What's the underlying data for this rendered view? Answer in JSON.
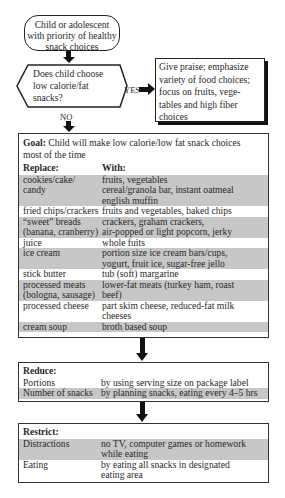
{
  "start": {
    "lines": [
      "Child or adolescent",
      "with priority of healthy",
      "snack choices"
    ]
  },
  "decision": {
    "lines": [
      "Does child choose",
      "low calorie/fat",
      "snacks?"
    ],
    "yes_label": "YES",
    "no_label": "NO"
  },
  "praise": {
    "lines": [
      "Give praise; emphasize",
      "variety of food choices;",
      "focus on fruits, vege-",
      "tables and high fiber",
      "choices"
    ]
  },
  "goal": {
    "title_bold": "Goal:",
    "title_rest": " Child will make low calorie/low fat snack choices",
    "title_line2": "most of the time",
    "col_replace": "Replace:",
    "col_with": "With:",
    "rows": [
      {
        "replace": [
          "cookies/cake/",
          "candy"
        ],
        "with": [
          "fruits, vegetables",
          "cereal/granola bar, instant oatmeal",
          "english muffin"
        ],
        "shade": "gray"
      },
      {
        "replace": [
          "fried chips/crackers"
        ],
        "with": [
          "fruits and vegetables, baked chips"
        ],
        "shade": "white"
      },
      {
        "replace": [
          "“sweet” breads",
          "(banana, cranberry)"
        ],
        "with": [
          "crackers, graham crackers,",
          "air-popped or light popcorn, jerky"
        ],
        "shade": "gray"
      },
      {
        "replace": [
          "juice"
        ],
        "with": [
          "whole fuits"
        ],
        "shade": "white"
      },
      {
        "replace": [
          "ice cream"
        ],
        "with": [
          "portion size ice cream bars/cups,",
          "yogurt, fruit ice, sugar-free jello"
        ],
        "shade": "gray"
      },
      {
        "replace": [
          "stick butter"
        ],
        "with": [
          "tub (soft) margarine"
        ],
        "shade": "white"
      },
      {
        "replace": [
          "processed meats",
          "(bologna, sausage)"
        ],
        "with": [
          "lower-fat meats (turkey ham, roast",
          "beef)"
        ],
        "shade": "gray"
      },
      {
        "replace": [
          "processed cheese"
        ],
        "with": [
          "part skim cheese, reduced-fat milk",
          "cheeses"
        ],
        "shade": "white"
      },
      {
        "replace": [
          "cream soup"
        ],
        "with": [
          "broth based soup"
        ],
        "shade": "gray"
      }
    ]
  },
  "reduce": {
    "title": "Reduce:",
    "rows": [
      {
        "item": "Portions",
        "how": [
          "by using serving size on package label"
        ],
        "shade": "white"
      },
      {
        "item": "Number of snacks",
        "how": [
          "by planning snacks, eating every 4–5 hrs"
        ],
        "shade": "gray"
      }
    ]
  },
  "restrict": {
    "title": "Restrict:",
    "rows": [
      {
        "item": "Distractions",
        "how": [
          "no TV, computer games or homework",
          "while eating"
        ],
        "shade": "gray"
      },
      {
        "item": "Eating",
        "how": [
          "by eating all snacks in designated",
          "eating area"
        ],
        "shade": "white"
      }
    ]
  },
  "colors": {
    "row_gray": "#c7c7c7",
    "border": "#222222",
    "arrow": "#111111"
  }
}
